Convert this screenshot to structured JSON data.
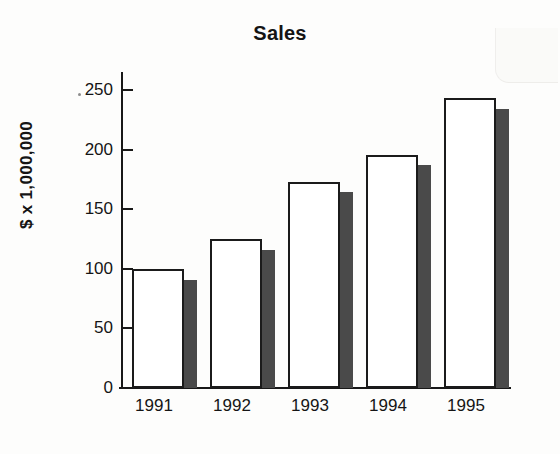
{
  "chart_data": {
    "type": "bar",
    "title": "Sales",
    "xlabel": "",
    "ylabel": "$ x 1,000,000",
    "categories": [
      "1991",
      "1992",
      "1993",
      "1994",
      "1995"
    ],
    "values": [
      100,
      125,
      173,
      195,
      243
    ],
    "shadow_values": [
      91,
      116,
      164,
      187,
      234
    ],
    "ylim": [
      0,
      265
    ],
    "yticks": [
      0,
      50,
      100,
      150,
      200,
      250
    ],
    "ytick_labels": [
      "0",
      "50",
      "100",
      "150",
      "200",
      "250"
    ],
    "grid": false,
    "legend": false,
    "series": [
      {
        "name": "Sales",
        "values": [
          100,
          125,
          173,
          195,
          243
        ]
      }
    ],
    "style": {
      "bar_face_color": "#ffffff",
      "bar_edge_color": "#1b1b1b",
      "bar_shadow_color": "#4a4a4a",
      "axis_color": "#181818",
      "text_color": "#151515",
      "background": "#fdfdfc"
    }
  }
}
